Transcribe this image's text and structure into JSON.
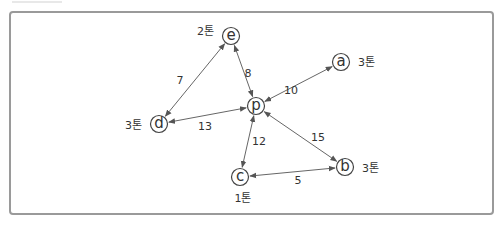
{
  "diagram": {
    "nodes": [
      {
        "id": "p",
        "label": "p",
        "weight": ""
      },
      {
        "id": "a",
        "label": "a",
        "weight": "3톤"
      },
      {
        "id": "b",
        "label": "b",
        "weight": "3톤"
      },
      {
        "id": "c",
        "label": "c",
        "weight": "1톤"
      },
      {
        "id": "d",
        "label": "d",
        "weight": "3톤"
      },
      {
        "id": "e",
        "label": "e",
        "weight": "2톤"
      }
    ],
    "edges": [
      {
        "from": "p",
        "to": "a",
        "distance": "10"
      },
      {
        "from": "p",
        "to": "b",
        "distance": "15"
      },
      {
        "from": "p",
        "to": "c",
        "distance": "12"
      },
      {
        "from": "p",
        "to": "d",
        "distance": "13"
      },
      {
        "from": "p",
        "to": "e",
        "distance": "8"
      },
      {
        "from": "d",
        "to": "e",
        "distance": "7"
      },
      {
        "from": "c",
        "to": "b",
        "distance": "5"
      }
    ]
  }
}
